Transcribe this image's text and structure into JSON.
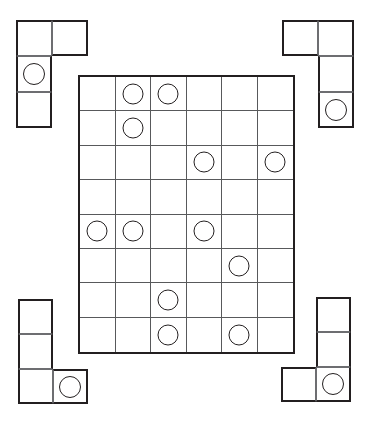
{
  "canvas": {
    "width": 372,
    "height": 426,
    "background": "#ffffff",
    "line_color": "#231f20",
    "inner_line_color": "#58595b"
  },
  "board": {
    "name": "main-grid",
    "columns": 6,
    "rows": 8,
    "left": 78,
    "top": 75,
    "cell_width": 35.5,
    "cell_height": 34.4,
    "token_shape": "circle",
    "token_fill": "#ffffff",
    "token_stroke": "#231f20",
    "occupancy": [
      [
        false,
        true,
        true,
        false,
        false,
        false
      ],
      [
        false,
        true,
        false,
        false,
        false,
        false
      ],
      [
        false,
        false,
        false,
        true,
        false,
        true
      ],
      [
        false,
        false,
        false,
        false,
        false,
        false
      ],
      [
        true,
        true,
        false,
        true,
        false,
        false
      ],
      [
        false,
        false,
        false,
        false,
        true,
        false
      ],
      [
        false,
        false,
        true,
        false,
        false,
        false
      ],
      [
        false,
        false,
        true,
        false,
        true,
        false
      ]
    ],
    "token_cells": [
      {
        "row": 1,
        "col": 2
      },
      {
        "row": 1,
        "col": 3
      },
      {
        "row": 2,
        "col": 2
      },
      {
        "row": 3,
        "col": 4
      },
      {
        "row": 3,
        "col": 6
      },
      {
        "row": 5,
        "col": 1
      },
      {
        "row": 5,
        "col": 2
      },
      {
        "row": 5,
        "col": 4
      },
      {
        "row": 6,
        "col": 5
      },
      {
        "row": 7,
        "col": 3
      },
      {
        "row": 8,
        "col": 3
      },
      {
        "row": 8,
        "col": 5
      }
    ],
    "token_count": 12
  },
  "pieces": [
    {
      "id": "piece-top-left",
      "label": "top-left-L-piece",
      "left": 16,
      "top": 20,
      "cell": 36,
      "shape": "J",
      "cells": [
        {
          "cx": 0,
          "cy": 0,
          "token": false
        },
        {
          "cx": 1,
          "cy": 0,
          "token": false
        },
        {
          "cx": 0,
          "cy": 1,
          "token": true
        },
        {
          "cx": 0,
          "cy": 2,
          "token": false
        }
      ],
      "token_count": 1
    },
    {
      "id": "piece-top-right",
      "label": "top-right-L-piece",
      "left": 282,
      "top": 20,
      "cell": 36,
      "shape": "L-mirrored",
      "cells": [
        {
          "cx": 0,
          "cy": 0,
          "token": false
        },
        {
          "cx": 1,
          "cy": 0,
          "token": false
        },
        {
          "cx": 1,
          "cy": 1,
          "token": false
        },
        {
          "cx": 1,
          "cy": 2,
          "token": true
        }
      ],
      "token_count": 1
    },
    {
      "id": "piece-bottom-left",
      "label": "bottom-left-L-piece",
      "left": 18,
      "top": 299,
      "cell": 35,
      "shape": "L",
      "cells": [
        {
          "cx": 0,
          "cy": 0,
          "token": false
        },
        {
          "cx": 0,
          "cy": 1,
          "token": false
        },
        {
          "cx": 0,
          "cy": 2,
          "token": false
        },
        {
          "cx": 1,
          "cy": 2,
          "token": true
        }
      ],
      "token_count": 1
    },
    {
      "id": "piece-bottom-right",
      "label": "bottom-right-J-piece",
      "left": 281,
      "top": 297,
      "cell": 35,
      "shape": "J",
      "cells": [
        {
          "cx": 1,
          "cy": 0,
          "token": false
        },
        {
          "cx": 1,
          "cy": 1,
          "token": false
        },
        {
          "cx": 0,
          "cy": 2,
          "token": false
        },
        {
          "cx": 1,
          "cy": 2,
          "token": true
        }
      ],
      "token_count": 1
    }
  ]
}
